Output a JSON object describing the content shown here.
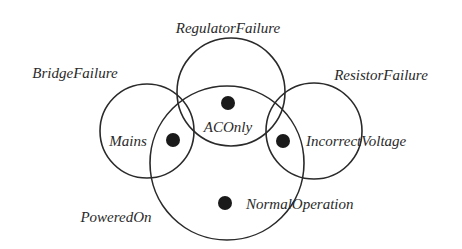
{
  "diagram": {
    "type": "euler-diagram",
    "colors": {
      "stroke": "#2a2a2a",
      "dot": "#1a1a1a",
      "background": "#ffffff"
    },
    "sets": [
      {
        "id": "regulator",
        "label": "RegulatorFailure",
        "cx": 231,
        "cy": 92,
        "r": 54,
        "label_x": 228,
        "label_y": 33
      },
      {
        "id": "bridge",
        "label": "BridgeFailure",
        "cx": 147,
        "cy": 131,
        "r": 47,
        "label_x": 75,
        "label_y": 78
      },
      {
        "id": "resistor",
        "label": "ResistorFailure",
        "cx": 314,
        "cy": 131,
        "r": 48,
        "label_x": 381,
        "label_y": 80
      },
      {
        "id": "powered",
        "label": "PoweredOn",
        "cx": 227,
        "cy": 163,
        "r": 77,
        "label_x": 116,
        "label_y": 222
      }
    ],
    "states": [
      {
        "id": "aconly",
        "label": "ACOnly",
        "dot_x": 228,
        "dot_y": 103,
        "label_x": 228,
        "label_y": 132,
        "anchor": "middle"
      },
      {
        "id": "mains",
        "label": "Mains",
        "dot_x": 173,
        "dot_y": 140,
        "label_x": 128,
        "label_y": 146,
        "anchor": "middle"
      },
      {
        "id": "incorrect",
        "label": "IncorrectVoltage",
        "dot_x": 283,
        "dot_y": 141,
        "label_x": 306,
        "label_y": 146,
        "anchor": "start"
      },
      {
        "id": "normal",
        "label": "NormalOperation",
        "dot_x": 225,
        "dot_y": 203,
        "label_x": 246,
        "label_y": 209,
        "anchor": "start"
      }
    ]
  }
}
